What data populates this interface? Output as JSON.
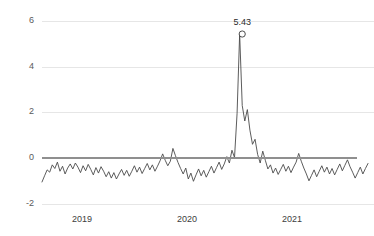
{
  "chart_data": {
    "type": "line",
    "title": "",
    "subtitle": "",
    "xlabel": "",
    "ylabel": "",
    "ylim": [
      -2,
      6
    ],
    "yticks": [
      6,
      4,
      2,
      0,
      -2
    ],
    "ytick_labels": [
      "6",
      "4",
      "2",
      "0",
      "-2"
    ],
    "xticks": [
      2019,
      2020,
      2021
    ],
    "xtick_labels": [
      "2019",
      "2020",
      "2021"
    ],
    "grid": "horizontal",
    "legend": "none",
    "zero_line": true,
    "series_name": "value",
    "line_color": "#4a4a4a",
    "grid_color": "#e6e6e6",
    "zero_line_color": "#8f8f8f",
    "annotations": [
      {
        "name": "peak",
        "label": "5.43",
        "value": 5.43,
        "x_index": 78,
        "marker": "open-circle"
      }
    ],
    "x_start": 2018.62,
    "x_end": 2021.78,
    "x_step": 0.0192,
    "values": [
      -1.05,
      -0.78,
      -0.52,
      -0.62,
      -0.3,
      -0.46,
      -0.18,
      -0.58,
      -0.36,
      -0.7,
      -0.44,
      -0.26,
      -0.48,
      -0.22,
      -0.4,
      -0.64,
      -0.34,
      -0.56,
      -0.28,
      -0.5,
      -0.74,
      -0.42,
      -0.66,
      -0.38,
      -0.58,
      -0.82,
      -0.6,
      -0.88,
      -0.64,
      -0.92,
      -0.7,
      -0.5,
      -0.76,
      -0.54,
      -0.8,
      -0.58,
      -0.34,
      -0.62,
      -0.4,
      -0.68,
      -0.46,
      -0.24,
      -0.52,
      -0.3,
      -0.58,
      -0.36,
      -0.12,
      0.18,
      -0.1,
      -0.34,
      -0.14,
      0.42,
      0.1,
      -0.2,
      -0.46,
      -0.7,
      -0.44,
      -0.92,
      -0.66,
      -1.02,
      -0.74,
      -0.48,
      -0.78,
      -0.54,
      -0.84,
      -0.6,
      -0.36,
      -0.66,
      -0.42,
      -0.18,
      -0.5,
      -0.26,
      0.06,
      -0.22,
      0.34,
      0.02,
      1.96,
      5.43,
      2.3,
      1.62,
      2.12,
      1.22,
      0.6,
      0.82,
      0.16,
      -0.22,
      0.3,
      -0.1,
      -0.48,
      -0.3,
      -0.66,
      -0.44,
      -0.72,
      -0.5,
      -0.28,
      -0.58,
      -0.36,
      -0.64,
      -0.4,
      -0.18,
      0.2,
      -0.14,
      -0.44,
      -0.7,
      -1.0,
      -0.76,
      -0.52,
      -0.82,
      -0.58,
      -0.34,
      -0.62,
      -0.4,
      -0.7,
      -0.46,
      -0.74,
      -0.5,
      -0.26,
      -0.56,
      -0.32,
      -0.08,
      -0.38,
      -0.62,
      -0.88,
      -0.64,
      -0.4,
      -0.7,
      -0.46,
      -0.24
    ]
  },
  "axis": {
    "y_labels": [
      "6",
      "4",
      "2",
      "0",
      "-2"
    ],
    "x_labels": [
      "2019",
      "2020",
      "2021"
    ]
  },
  "peak": {
    "label": "5.43"
  }
}
